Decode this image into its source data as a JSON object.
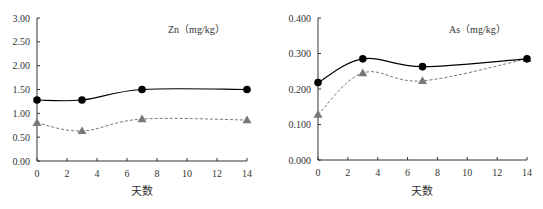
{
  "chart_data": [
    {
      "type": "line",
      "title": "Zn（mg/kg）",
      "xlabel": "天数",
      "ylabel": "",
      "x": [
        0,
        3,
        7,
        14
      ],
      "xticks": [
        0,
        2,
        4,
        6,
        8,
        10,
        12,
        14
      ],
      "xlim": [
        0,
        14
      ],
      "ylim": [
        0,
        3
      ],
      "yticks": [
        "0.00",
        "0.50",
        "1.00",
        "1.50",
        "2.00",
        "2.50",
        "3.00"
      ],
      "grid": false,
      "legend": "none",
      "series": [
        {
          "name": "circle-solid",
          "marker": "circle",
          "line": "solid",
          "color": "#000000",
          "values": [
            1.28,
            1.28,
            1.5,
            1.5
          ]
        },
        {
          "name": "triangle-dashed",
          "marker": "triangle",
          "line": "dashed",
          "color": "#777777",
          "values": [
            0.8,
            0.63,
            0.88,
            0.86
          ]
        }
      ]
    },
    {
      "type": "line",
      "title": "As（mg/kg）",
      "xlabel": "天数",
      "ylabel": "",
      "x": [
        0,
        3,
        7,
        14
      ],
      "xticks": [
        0,
        2,
        4,
        6,
        8,
        10,
        12,
        14
      ],
      "xlim": [
        0,
        14
      ],
      "ylim": [
        0,
        0.4
      ],
      "yticks": [
        "0.000",
        "0.100",
        "0.200",
        "0.300",
        "0.400"
      ],
      "grid": false,
      "legend": "none",
      "series": [
        {
          "name": "circle-solid",
          "marker": "circle",
          "line": "solid",
          "color": "#000000",
          "values": [
            0.218,
            0.285,
            0.263,
            0.285
          ]
        },
        {
          "name": "triangle-dashed",
          "marker": "triangle",
          "line": "dashed",
          "color": "#777777",
          "values": [
            0.128,
            0.245,
            0.223,
            0.285
          ]
        }
      ]
    }
  ],
  "layout": [
    {
      "left": 37,
      "right": 247,
      "top": 18,
      "bottom": 161,
      "title_x": 168,
      "title_y": 33,
      "xlabel_x": 142,
      "xlabel_y": 195,
      "ymax": 3
    },
    {
      "left": 318,
      "right": 527,
      "top": 18,
      "bottom": 160,
      "title_x": 449,
      "title_y": 33,
      "xlabel_x": 422,
      "xlabel_y": 195,
      "ymax": 0.4
    }
  ]
}
